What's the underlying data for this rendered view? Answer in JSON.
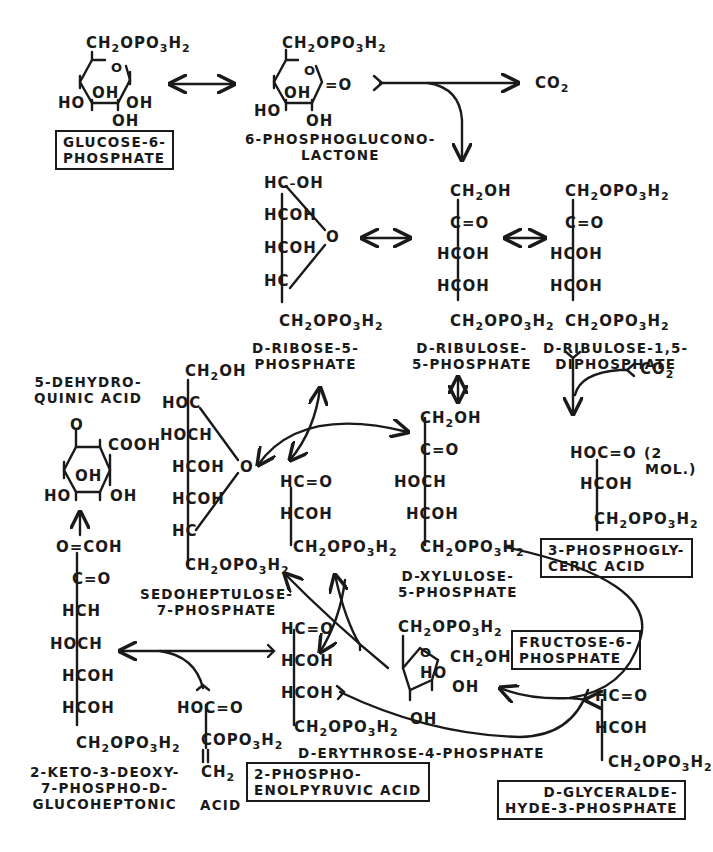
{
  "diagram": {
    "compounds": {
      "glucose_6_phosphate": {
        "label": "GLUCOSE-6-\nPHOSPHATE",
        "boxed": true,
        "formula": [
          "CH2OPO3H2",
          "HO",
          "OH",
          "OH",
          "OH",
          "O"
        ]
      },
      "phosphogluconolactone": {
        "label": "6-PHOSPHOGLUCONO-\nLACTONE",
        "boxed": false,
        "formula": [
          "CH2OPO3H2",
          "O",
          "=O",
          "HO",
          "OH",
          "OH"
        ]
      },
      "co2_top": {
        "label": "CO2"
      },
      "d_ribose_5_phosphate": {
        "label": "D-RIBOSE-5-\nPHOSPHATE",
        "lines": [
          "HC-OH",
          "HCOH",
          "HCOH",
          "HC",
          "CH2OPO3H2"
        ],
        "ring_o": "O"
      },
      "d_ribulose_5_phosphate": {
        "label": "D-RIBULOSE-\n5-PHOSPHATE",
        "lines": [
          "CH2OH",
          "C=O",
          "HCOH",
          "HCOH",
          "CH2OPO3H2"
        ]
      },
      "d_ribulose_1_5_diphosphate": {
        "label": "D-RIBULOSE-1,5-\nDIPHOSPHATE",
        "lines": [
          "CH2OPO3H2",
          "C=O",
          "HCOH",
          "HCOH",
          "CH2OPO3H2"
        ]
      },
      "co2_mid": {
        "label": "CO2"
      },
      "phosphoglyceric_acid": {
        "label": "3-PHOSPHOGLY-\nCERIC ACID",
        "boxed": true,
        "lines": [
          "HOC=O",
          "HCOH",
          "CH2OPO3H2"
        ],
        "note": "(2 MOL.)"
      },
      "dehydroquinic_acid": {
        "label": "5-DEHYDRO-\nQUINIC ACID",
        "formula": [
          "O",
          "COOH",
          "OH",
          "HO",
          "OH"
        ]
      },
      "sedoheptulose_7_phosphate": {
        "label": "SEDOHEPTULOSE-\n7-PHOSPHATE",
        "lines": [
          "CH2OH",
          "HOC",
          "HOCH",
          "HCOH",
          "HCOH",
          "HC",
          "CH2OPO3H2"
        ],
        "ring_o": "O"
      },
      "glyceraldehyde_intermediate": {
        "lines": [
          "HC=O",
          "HCOH",
          "CH2OPO3H2"
        ]
      },
      "d_xylulose_5_phosphate": {
        "label": "D-XYLULOSE-\n5-PHOSPHATE",
        "lines": [
          "CH2OH",
          "C=O",
          "HOCH",
          "HCOH",
          "CH2OPO3H2"
        ]
      },
      "keto_deoxy_glucoheptonic_acid": {
        "label": "2-KETO-3-DEOXY-\n7-PHOSPHO-D-\nGLUCOHEPTONIC",
        "lines": [
          "O=COH",
          "C=O",
          "HCH",
          "HOCH",
          "HCOH",
          "HCOH",
          "CH2OPO3H2"
        ]
      },
      "phosphoenolpyruvic_acid": {
        "label": "2-PHOSPHO-\nENOLPYRUVIC ACID",
        "boxed": true,
        "lines": [
          "HOC=O",
          "COPO3H2",
          "CH2"
        ],
        "acid_word": "ACID"
      },
      "d_erythrose_4_phosphate": {
        "label": "D-ERYTHROSE-4-PHOSPHATE",
        "lines": [
          "HC=O",
          "HCOH",
          "HCOH",
          "CH2OPO3H2"
        ]
      },
      "fructose_6_phosphate": {
        "label": "FRUCTOSE-6-\nPHOSPHATE",
        "boxed": true,
        "formula": [
          "CH2OPO3H2",
          "O",
          "CH2OH",
          "HO",
          "OH",
          "OH"
        ]
      },
      "d_glyceraldehyde_3_phosphate": {
        "label": "D-GLYCERALDE-\nHYDE-3-PHOSPHATE",
        "boxed": true,
        "lines": [
          "HC=O",
          "HCOH",
          "CH2OPO3H2"
        ]
      }
    },
    "colors": {
      "ink": "#1a1a1a",
      "paper": "#ffffff"
    }
  }
}
